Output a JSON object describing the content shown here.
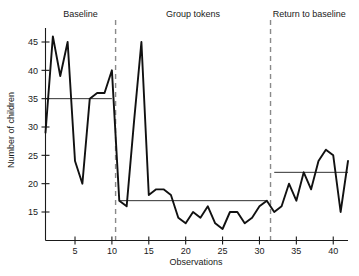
{
  "chart_data": {
    "type": "line",
    "title": "",
    "xlabel": "Observations",
    "ylabel": "Number of children",
    "xlim": [
      1,
      42
    ],
    "ylim": [
      12,
      47
    ],
    "grid": false,
    "legend_position": "none",
    "x_ticks": [
      5,
      10,
      15,
      20,
      25,
      30,
      35,
      40
    ],
    "y_ticks": [
      15,
      20,
      25,
      30,
      35,
      40,
      45
    ],
    "x": [
      1,
      2,
      3,
      4,
      5,
      6,
      7,
      8,
      9,
      10,
      11,
      12,
      13,
      14,
      15,
      16,
      17,
      18,
      19,
      20,
      21,
      22,
      23,
      24,
      25,
      26,
      27,
      28,
      29,
      30,
      31,
      32,
      33,
      34,
      35,
      36,
      37,
      38,
      39,
      40,
      41,
      42
    ],
    "values": [
      29,
      46,
      39,
      45,
      24,
      20,
      35,
      36,
      36,
      40,
      17,
      16,
      31,
      45,
      18,
      19,
      19,
      18,
      14,
      13,
      15,
      14,
      16,
      13,
      12,
      15,
      15,
      13,
      14,
      16,
      17,
      15,
      16,
      20,
      17,
      22,
      19,
      24,
      26,
      25,
      15,
      24
    ],
    "series": [
      {
        "name": "Number of children",
        "values": [
          29,
          46,
          39,
          45,
          24,
          20,
          35,
          36,
          36,
          40,
          17,
          16,
          31,
          45,
          18,
          19,
          19,
          18,
          14,
          13,
          15,
          14,
          16,
          13,
          12,
          15,
          15,
          13,
          14,
          16,
          17,
          15,
          16,
          20,
          17,
          22,
          19,
          24,
          26,
          25,
          15,
          24
        ]
      }
    ],
    "phases": [
      {
        "label": "Baseline",
        "x_start": 1,
        "x_end": 10.5,
        "mean": 35,
        "mean_x_start": 1,
        "mean_x_end": 10
      },
      {
        "label": "Group tokens",
        "x_start": 10.5,
        "x_end": 31.5,
        "mean": 17,
        "mean_x_start": 11,
        "mean_x_end": 31
      },
      {
        "label": "Return to baseline",
        "x_start": 31.5,
        "x_end": 42,
        "mean": 22,
        "mean_x_start": 32,
        "mean_x_end": 42
      }
    ],
    "dividers": [
      10.5,
      31.5
    ],
    "colors": {
      "line": "#111111",
      "mean_line": "#1a1a1a",
      "divider": "#8a8a8a",
      "axis": "#1a1a1a",
      "background": "#ffffff"
    }
  }
}
